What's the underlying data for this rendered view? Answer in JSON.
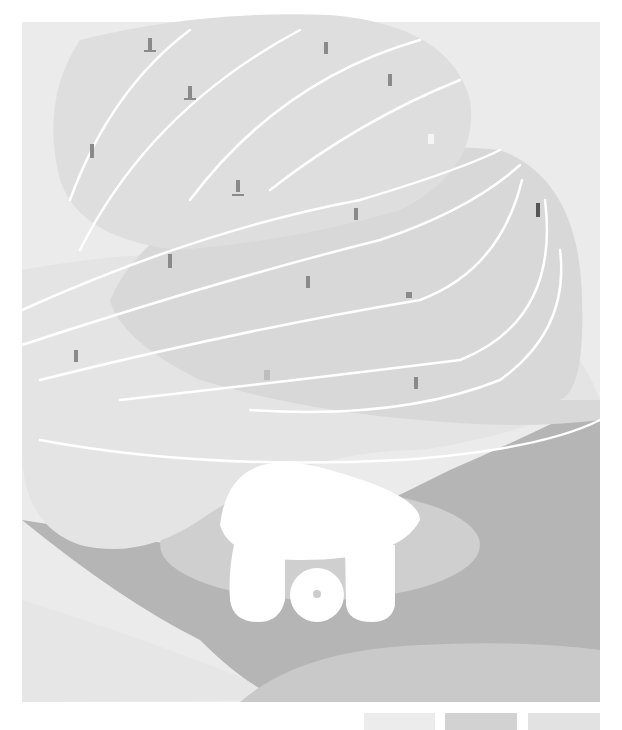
{
  "artwork": {
    "title_letters": "SOT",
    "description": "Soft-serve swirl shaped like a snowy mountain with tiny skiers on curving white trails"
  },
  "colors": {
    "background": "#ffffff",
    "panel": "#ebebeb",
    "swirl_top": "#dedede",
    "swirl_mid": "#d6d6d6",
    "swirl_base": "#e6e6e6",
    "dark_band": "#b3b3b3",
    "mid_band": "#c4c4c4",
    "cup": "#cfcfcf",
    "letters": "#ffffff",
    "trail": "#ffffff",
    "skier": "#8a8a8a"
  },
  "swatches": [
    {
      "name": "light",
      "color": "#ececec",
      "x": 364,
      "w": 71
    },
    {
      "name": "mid",
      "color": "#d2d2d2",
      "x": 445,
      "w": 72
    },
    {
      "name": "pale",
      "color": "#e2e2e2",
      "x": 528,
      "w": 72
    }
  ],
  "skiers": [
    {
      "x": 150,
      "y": 45
    },
    {
      "x": 190,
      "y": 92
    },
    {
      "x": 92,
      "y": 150
    },
    {
      "x": 238,
      "y": 185
    },
    {
      "x": 326,
      "y": 48
    },
    {
      "x": 390,
      "y": 80
    },
    {
      "x": 430,
      "y": 140
    },
    {
      "x": 356,
      "y": 215
    },
    {
      "x": 170,
      "y": 262
    },
    {
      "x": 308,
      "y": 284
    },
    {
      "x": 408,
      "y": 296
    },
    {
      "x": 76,
      "y": 358
    },
    {
      "x": 268,
      "y": 376
    },
    {
      "x": 416,
      "y": 384
    },
    {
      "x": 538,
      "y": 210
    }
  ]
}
